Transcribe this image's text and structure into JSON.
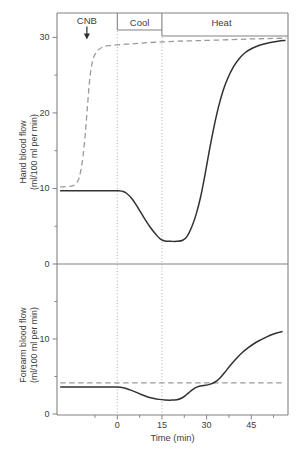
{
  "figure": {
    "phases": {
      "cnb": "CNB",
      "cool": "Cool",
      "heat": "Heat"
    },
    "x_axis": {
      "title": "Time (min)",
      "major_ticks": [
        0,
        15,
        30,
        45
      ],
      "minor_ticks": [
        -7.5,
        7.5,
        22.5,
        37.5,
        52.5
      ]
    },
    "top_panel": {
      "ylabel_line1": "Hand blood flow",
      "ylabel_line2": "(ml/100 ml per min)",
      "major_ticks": [
        0,
        10,
        20,
        30
      ],
      "minor_ticks": [
        5,
        15,
        25
      ]
    },
    "bottom_panel": {
      "ylabel_line1": "Forearm blood flow",
      "ylabel_line2": "(ml/100 ml per min)",
      "major_ticks": [
        0,
        10
      ],
      "minor_ticks": [
        5,
        15
      ]
    },
    "colors": {
      "solid_line": "#323232",
      "dashed_line": "#9a9a9a",
      "axis": "#828282",
      "dotted_guide": "#aeaeae",
      "text": "#3d3d3d"
    }
  },
  "chart_data": [
    {
      "type": "line",
      "panel": "top",
      "title": "",
      "xlabel": "Time (min)",
      "ylabel": "Hand blood flow (ml/100 ml per min)",
      "xlim": [
        -20.2,
        57.5
      ],
      "ylim": [
        0,
        33.2
      ],
      "yticks": [
        0,
        10,
        20,
        30
      ],
      "guide_vlines": [
        0,
        15
      ],
      "phase_marks": {
        "cnb_arrow_time": -10.2,
        "cool_interval": [
          0,
          15
        ],
        "heat_interval": [
          15,
          57.5
        ]
      },
      "series": [
        {
          "name": "dashed-hand-flow",
          "style": "dashed",
          "color": "#9a9a9a",
          "points": [
            [
              -19.2,
              10.2
            ],
            [
              -17,
              10.25
            ],
            [
              -15,
              10.35
            ],
            [
              -14,
              10.6
            ],
            [
              -13,
              11.2
            ],
            [
              -12.3,
              12.3
            ],
            [
              -11.5,
              14.3
            ],
            [
              -10.7,
              17.5
            ],
            [
              -10,
              21.0
            ],
            [
              -9.3,
              24.3
            ],
            [
              -8.6,
              26.3
            ],
            [
              -7.8,
              27.5
            ],
            [
              -6.5,
              28.3
            ],
            [
              -5,
              28.7
            ],
            [
              -3,
              28.9
            ],
            [
              0,
              29.0
            ],
            [
              5,
              29.15
            ],
            [
              10,
              29.3
            ],
            [
              15,
              29.4
            ],
            [
              20,
              29.5
            ],
            [
              25,
              29.55
            ],
            [
              30,
              29.6
            ],
            [
              38,
              29.7
            ],
            [
              45,
              29.8
            ],
            [
              51,
              29.85
            ],
            [
              56.8,
              29.9
            ]
          ]
        },
        {
          "name": "solid-hand-flow",
          "style": "solid",
          "color": "#323232",
          "points": [
            [
              -19.2,
              9.7
            ],
            [
              -15,
              9.7
            ],
            [
              -10,
              9.7
            ],
            [
              -5,
              9.7
            ],
            [
              0,
              9.7
            ],
            [
              1.5,
              9.65
            ],
            [
              3,
              9.4
            ],
            [
              5,
              8.6
            ],
            [
              7,
              7.4
            ],
            [
              9,
              6.1
            ],
            [
              11,
              4.9
            ],
            [
              13,
              3.9
            ],
            [
              14.5,
              3.3
            ],
            [
              16,
              3.05
            ],
            [
              18,
              3.0
            ],
            [
              20,
              3.0
            ],
            [
              22,
              3.15
            ],
            [
              23.5,
              3.7
            ],
            [
              25,
              4.9
            ],
            [
              26.5,
              6.6
            ],
            [
              28,
              8.9
            ],
            [
              29.5,
              11.9
            ],
            [
              31,
              15.2
            ],
            [
              32.5,
              18.2
            ],
            [
              34,
              20.8
            ],
            [
              35.5,
              22.9
            ],
            [
              37,
              24.5
            ],
            [
              39,
              26.1
            ],
            [
              41,
              27.2
            ],
            [
              43,
              28.0
            ],
            [
              45.5,
              28.6
            ],
            [
              48,
              29.0
            ],
            [
              51,
              29.3
            ],
            [
              54,
              29.5
            ],
            [
              56.5,
              29.6
            ]
          ]
        }
      ]
    },
    {
      "type": "line",
      "panel": "bottom",
      "title": "",
      "xlabel": "Time (min)",
      "ylabel": "Forearm blood flow (ml/100 ml per min)",
      "xlim": [
        -20.2,
        57.5
      ],
      "ylim": [
        0,
        20
      ],
      "yticks": [
        0,
        10
      ],
      "guide_vlines": [
        0,
        15
      ],
      "series": [
        {
          "name": "dashed-forearm-baseline",
          "style": "dashed",
          "color": "#9a9a9a",
          "points": [
            [
              -19.2,
              4.15
            ],
            [
              56.3,
              4.15
            ]
          ]
        },
        {
          "name": "solid-forearm-flow",
          "style": "solid",
          "color": "#323232",
          "points": [
            [
              -19.2,
              3.6
            ],
            [
              -10,
              3.6
            ],
            [
              -3,
              3.6
            ],
            [
              0,
              3.6
            ],
            [
              2,
              3.5
            ],
            [
              4,
              3.25
            ],
            [
              6,
              2.95
            ],
            [
              8,
              2.6
            ],
            [
              10,
              2.3
            ],
            [
              12,
              2.1
            ],
            [
              14,
              1.95
            ],
            [
              16,
              1.87
            ],
            [
              18,
              1.85
            ],
            [
              20,
              1.9
            ],
            [
              21.5,
              2.1
            ],
            [
              23,
              2.5
            ],
            [
              24.5,
              3.0
            ],
            [
              26,
              3.45
            ],
            [
              27.5,
              3.7
            ],
            [
              29,
              3.8
            ],
            [
              31,
              3.95
            ],
            [
              33,
              4.3
            ],
            [
              34.5,
              4.8
            ],
            [
              36,
              5.5
            ],
            [
              38,
              6.5
            ],
            [
              40,
              7.4
            ],
            [
              42,
              8.2
            ],
            [
              44,
              8.85
            ],
            [
              46,
              9.4
            ],
            [
              48,
              9.85
            ],
            [
              50,
              10.25
            ],
            [
              52,
              10.6
            ],
            [
              54,
              10.85
            ],
            [
              55.5,
              11.0
            ]
          ]
        }
      ]
    }
  ]
}
